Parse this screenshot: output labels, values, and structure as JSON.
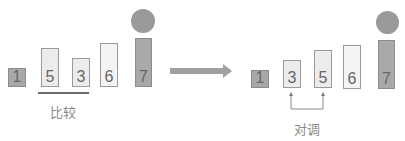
{
  "title_partial": "",
  "colors": {
    "bar_light": "#ececec",
    "bar_dark": "#a8a8a8",
    "bar_border": "#9a9a9a",
    "circle": "#9a9a9a",
    "arrow": "#9e9e9e",
    "text": "#8a8a8a"
  },
  "before": {
    "bars": [
      {
        "value": "1",
        "style": "dark"
      },
      {
        "value": "5",
        "style": "light"
      },
      {
        "value": "3",
        "style": "light"
      },
      {
        "value": "6",
        "style": "lighter"
      },
      {
        "value": "7",
        "style": "dark",
        "has_marker": true
      }
    ],
    "compare_label": "比较"
  },
  "after": {
    "bars": [
      {
        "value": "1",
        "style": "dark"
      },
      {
        "value": "3",
        "style": "light"
      },
      {
        "value": "5",
        "style": "light"
      },
      {
        "value": "6",
        "style": "lighter"
      },
      {
        "value": "7",
        "style": "dark",
        "has_marker": true
      }
    ],
    "swap_label": "对调"
  },
  "transition_arrow": "right-arrow"
}
